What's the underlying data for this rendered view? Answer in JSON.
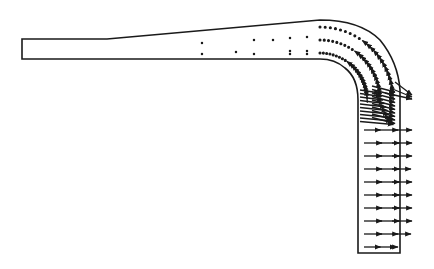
{
  "diagram": {
    "type": "velocity-vector-field",
    "background": "#ffffff",
    "stroke": "#1a1a1a",
    "channel": {
      "inlet": {
        "x": 22,
        "top": 39,
        "bottom": 59
      },
      "taper_start_x": 107,
      "outer_wall_peak": {
        "x": 320,
        "y": 20
      },
      "inner_corner_start_x": 320,
      "inner_wall_x": 358,
      "outer_wall_x": 400,
      "bottom_y": 253
    },
    "straight_rows_y": [
      130,
      143,
      156,
      169,
      182,
      195,
      208,
      221,
      234,
      247
    ],
    "straight_row_lengths": [
      [
        0.55,
        0.85,
        1.0
      ],
      [
        0.6,
        0.9,
        1.0
      ],
      [
        0.6,
        0.9,
        1.0
      ],
      [
        0.6,
        0.9,
        0.95
      ],
      [
        0.6,
        0.9,
        1.0
      ],
      [
        0.6,
        0.9,
        1.0
      ],
      [
        0.6,
        0.9,
        1.0
      ],
      [
        0.6,
        0.9,
        1.0
      ],
      [
        0.6,
        0.85,
        0.95
      ],
      [
        0.55,
        0.75,
        0.3
      ]
    ]
  }
}
